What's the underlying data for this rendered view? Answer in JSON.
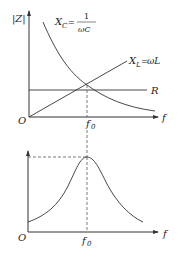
{
  "top_graph": {
    "y_label": "|Z|",
    "x_label": "f",
    "origin_label": "O",
    "resonance_label": {
      "main": "f",
      "sub": "0"
    },
    "curves": {
      "capacitive": {
        "label_main": "X",
        "label_sub": "C",
        "equals": "=",
        "numerator": "1",
        "denominator": "ωC"
      },
      "inductive": {
        "label_main": "X",
        "label_sub": "L",
        "equals": "=",
        "expr": "ωL"
      },
      "resistance": {
        "label": "R"
      }
    }
  },
  "bottom_graph": {
    "x_label": "f",
    "origin_label": "O",
    "resonance_label": {
      "main": "f",
      "sub": "0"
    },
    "curve": "resonance peak"
  }
}
